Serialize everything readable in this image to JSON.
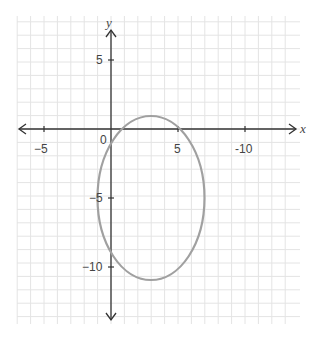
{
  "chart_data": {
    "type": "line",
    "title": "",
    "xlabel": "x",
    "ylabel": "y",
    "xlim": [
      -7,
      13.5
    ],
    "ylim": [
      -14.5,
      8.5
    ],
    "grid": true,
    "grid_step": 1,
    "x_tick_labels": [
      {
        "value": -5,
        "label": "−5"
      },
      {
        "value": 0,
        "label": "0"
      },
      {
        "value": 5,
        "label": "5"
      },
      {
        "value": 10,
        "label": "-10"
      }
    ],
    "y_tick_labels": [
      {
        "value": 5,
        "label": "5"
      },
      {
        "value": -5,
        "label": "−5"
      },
      {
        "value": -10,
        "label": "−10"
      }
    ],
    "series": [
      {
        "name": "ellipse",
        "shape": "ellipse",
        "center": [
          3,
          -5
        ],
        "semi_axis_x": 4,
        "semi_axis_y": 6,
        "equation": "(x-3)^2/16 + (y+5)^2/36 = 1",
        "color": "#999999"
      }
    ]
  },
  "labels": {
    "x_axis": "x",
    "y_axis": "y",
    "origin": "0",
    "xt_neg5": "−5",
    "xt_5": "5",
    "xt_10": "-10",
    "yt_5": "5",
    "yt_neg5": "−5",
    "yt_neg10": "−10"
  }
}
